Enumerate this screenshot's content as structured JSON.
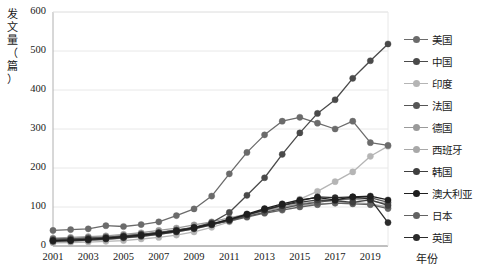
{
  "chart_data": {
    "type": "line",
    "title": "",
    "xlabel": "年份",
    "ylabel": "发文量（篇）",
    "ylabel_chars": [
      "发",
      "文",
      "量",
      "（",
      "篇",
      "）"
    ],
    "x": [
      2001,
      2002,
      2003,
      2004,
      2005,
      2006,
      2007,
      2008,
      2009,
      2010,
      2011,
      2012,
      2013,
      2014,
      2015,
      2016,
      2017,
      2018,
      2019,
      2020
    ],
    "xticks": [
      2001,
      2003,
      2005,
      2007,
      2009,
      2011,
      2013,
      2015,
      2017,
      2019
    ],
    "yticks": [
      0,
      100,
      200,
      300,
      400,
      500,
      600
    ],
    "ylim": [
      0,
      600
    ],
    "xlim": [
      2001,
      2020
    ],
    "grid": true,
    "legend_position": "right",
    "series": [
      {
        "name": "美国",
        "color": "#6b6b6b",
        "values": [
          40,
          42,
          44,
          52,
          50,
          55,
          62,
          78,
          95,
          128,
          185,
          240,
          285,
          320,
          330,
          315,
          300,
          320,
          265,
          258
        ]
      },
      {
        "name": "中国",
        "color": "#4a4a4a",
        "values": [
          14,
          16,
          18,
          20,
          24,
          30,
          34,
          40,
          48,
          60,
          86,
          130,
          175,
          235,
          290,
          340,
          375,
          430,
          475,
          518
        ]
      },
      {
        "name": "印度",
        "color": "#b5b5b5",
        "values": [
          8,
          9,
          10,
          12,
          14,
          18,
          22,
          28,
          36,
          48,
          62,
          78,
          92,
          105,
          120,
          140,
          165,
          190,
          230,
          256
        ]
      },
      {
        "name": "法国",
        "color": "#565656",
        "values": [
          16,
          18,
          20,
          22,
          26,
          30,
          34,
          40,
          46,
          56,
          66,
          76,
          86,
          96,
          106,
          112,
          118,
          122,
          124,
          112
        ]
      },
      {
        "name": "德国",
        "color": "#9a9a9a",
        "values": [
          20,
          22,
          24,
          26,
          30,
          34,
          40,
          46,
          54,
          62,
          72,
          82,
          92,
          100,
          108,
          114,
          118,
          120,
          116,
          108
        ]
      },
      {
        "name": "西班牙",
        "color": "#a8a8a8",
        "values": [
          10,
          12,
          14,
          16,
          20,
          24,
          30,
          36,
          44,
          54,
          66,
          78,
          90,
          98,
          104,
          108,
          110,
          112,
          108,
          100
        ]
      },
      {
        "name": "韩国",
        "color": "#3f3f3f",
        "values": [
          12,
          13,
          15,
          18,
          21,
          25,
          30,
          36,
          44,
          54,
          66,
          80,
          94,
          104,
          112,
          118,
          116,
          112,
          118,
          104
        ]
      },
      {
        "name": "澳大利亚",
        "color": "#1f1f1f",
        "values": [
          14,
          15,
          17,
          20,
          24,
          28,
          33,
          39,
          47,
          57,
          68,
          82,
          96,
          108,
          118,
          124,
          118,
          126,
          128,
          118
        ]
      },
      {
        "name": "日本",
        "color": "#636363",
        "values": [
          18,
          19,
          21,
          23,
          26,
          30,
          35,
          41,
          48,
          56,
          64,
          74,
          84,
          92,
          100,
          106,
          110,
          108,
          106,
          96
        ]
      },
      {
        "name": "英国",
        "color": "#2b2b2b",
        "values": [
          13,
          15,
          17,
          19,
          23,
          27,
          32,
          38,
          46,
          56,
          68,
          80,
          92,
          104,
          116,
          126,
          124,
          126,
          120,
          60
        ]
      }
    ]
  }
}
